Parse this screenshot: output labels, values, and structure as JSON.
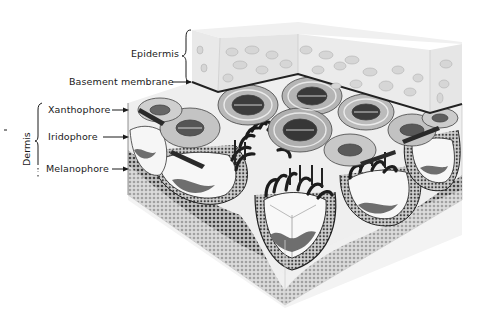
{
  "figure": {
    "type": "anatomical-illustration",
    "colors": {
      "background": "#ffffff",
      "ink": "#1a1a1a",
      "epidermis_fill": "#ececec",
      "epidermis_cell": "#d2d2d2",
      "dermis_dark": "#3a3a3a",
      "dermis_mid": "#8a8a8a",
      "dermis_light": "#f2f2f2"
    }
  },
  "labels": {
    "epidermis": "Epidermis",
    "basement_membrane": "Basement membrane",
    "dermis": "Dermis",
    "xanthophore": "Xanthophore",
    "iridophore": "Iridophore",
    "melanophore": "Melanophore"
  }
}
